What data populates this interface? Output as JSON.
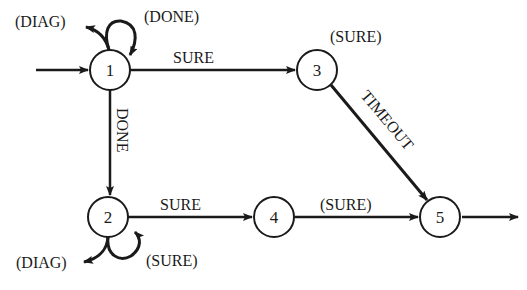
{
  "diagram": {
    "type": "state-transition",
    "colors": {
      "stroke": "#1a1a1a",
      "background": "#ffffff"
    },
    "nodes": [
      {
        "id": "1",
        "label": "1"
      },
      {
        "id": "2",
        "label": "2"
      },
      {
        "id": "3",
        "label": "3"
      },
      {
        "id": "4",
        "label": "4"
      },
      {
        "id": "5",
        "label": "5"
      }
    ],
    "edges": {
      "entry_to_1": "",
      "n1_self_done": "(DONE)",
      "n1_diag": "(DIAG)",
      "n1_to_3": "SURE",
      "n1_to_2": "DONE",
      "n3_self_sure": "(SURE)",
      "n3_to_5": "TIMEOUT",
      "n2_to_4": "SURE",
      "n2_diag": "(DIAG)",
      "n2_self_sure": "(SURE)",
      "n4_to_5": "(SURE)",
      "n5_exit": ""
    }
  }
}
